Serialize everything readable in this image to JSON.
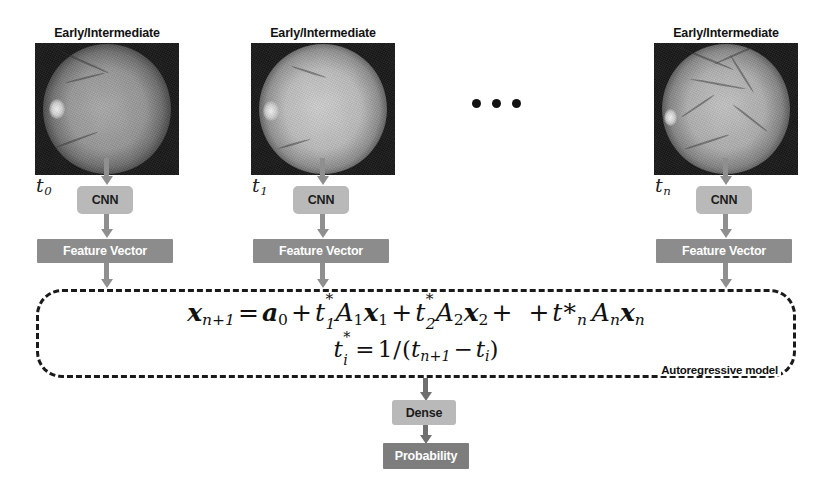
{
  "diagram": {
    "columns": [
      {
        "id": "t0",
        "stage_label": "Early/Intermediate",
        "time_label": "t",
        "time_sub": "0",
        "image_alt": "fundus-photograph",
        "cnn_label": "CNN",
        "feature_label": "Feature Vector"
      },
      {
        "id": "t1",
        "stage_label": "Early/Intermediate",
        "time_label": "t",
        "time_sub": "1",
        "image_alt": "fundus-photograph",
        "cnn_label": "CNN",
        "feature_label": "Feature Vector"
      },
      {
        "id": "tn",
        "stage_label": "Early/Intermediate",
        "time_label": "t",
        "time_sub": "n",
        "image_alt": "fundus-photograph",
        "cnn_label": "CNN",
        "feature_label": "Feature Vector"
      }
    ],
    "ellipsis": "•••",
    "autoregressive": {
      "panel_label": "Autoregressive model",
      "equation_line1": "x_{n+1} = a_0 + t_1^* A_1 x_1 + t_2^* A_2 x_2 +  + t *_n A_n x_n",
      "equation_line2": "t_i^* = 1/(t_{n+1} - t_i)",
      "eq1": {
        "lhs_var": "x",
        "lhs_sub": "n+1",
        "equals": "=",
        "a_var": "a",
        "a_sub": "0",
        "plus": "+",
        "term1": {
          "t": "t",
          "sub": "1",
          "star": "*",
          "A": "A",
          "A_sub": "1",
          "x": "x",
          "x_sub": "1"
        },
        "term2": {
          "t": "t",
          "sub": "2",
          "star": "*",
          "A": "A",
          "A_sub": "2",
          "x": "x",
          "x_sub": "2"
        },
        "termn": {
          "t": "t",
          "sub": "n",
          "star": "*",
          "A": "A",
          "A_sub": "n",
          "x": "x",
          "x_sub": "n"
        }
      },
      "eq2": {
        "t": "t",
        "sub": "i",
        "star": "*",
        "equals": "=",
        "one": "1",
        "slash": "/",
        "open": "(",
        "t_n1": "t",
        "t_n1_sub": "n+1",
        "minus": "−",
        "t_i": "t",
        "t_i_sub": "i",
        "close": ")"
      }
    },
    "output": {
      "dense_label": "Dense",
      "probability_label": "Probability"
    },
    "colors": {
      "cnn_box": "#b9b9b9",
      "feature_box": "#8c8c8c",
      "dense_box": "#b9b9b9",
      "probability_box": "#7d7d7d",
      "arrow": "#8f8f8f",
      "panel_border": "#1a1a1a",
      "text_dark": "#111111",
      "text_light": "#ffffff",
      "background": "#ffffff"
    }
  }
}
